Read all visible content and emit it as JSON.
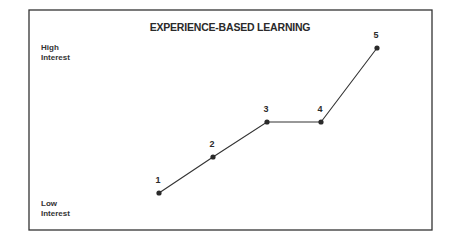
{
  "chart_data": {
    "type": "line",
    "title": "EXPERIENCE-BASED LEARNING",
    "xlabel": "",
    "ylabel": "Interest",
    "y_axis_labels": {
      "high": [
        "High",
        "Interest"
      ],
      "low": [
        "Low",
        "Interest"
      ]
    },
    "grid": false,
    "legend": null,
    "categories": [
      "1",
      "2",
      "3",
      "4",
      "5"
    ],
    "x": [
      1,
      2,
      3,
      4,
      5
    ],
    "values": [
      1,
      2,
      3,
      3,
      5
    ],
    "ylim": [
      0,
      5.5
    ],
    "point_labels": [
      "1",
      "2",
      "3",
      "4",
      "5"
    ],
    "style": {
      "line_color": "#333333",
      "marker_color": "#2a2a2a",
      "frame_color": "#333333"
    }
  },
  "frame": {
    "x": 29,
    "y": 10,
    "width": 403,
    "height": 220
  },
  "plot": {
    "x_positions": [
      159,
      213,
      267,
      321,
      377
    ],
    "y_positions": [
      193,
      157,
      122,
      122,
      48
    ]
  }
}
